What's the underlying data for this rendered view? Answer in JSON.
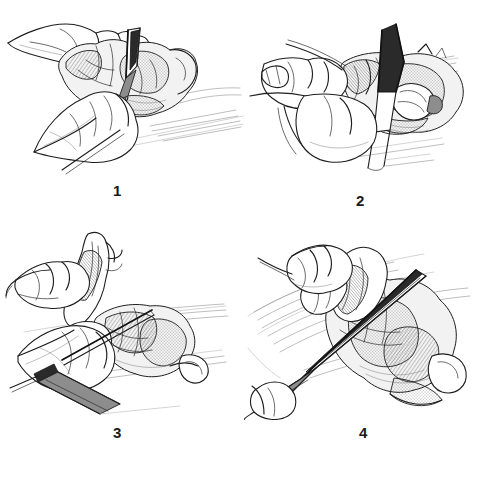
{
  "figure": {
    "style": "black-and-white pen-and-ink line drawing",
    "background_color": "#ffffff",
    "ink_color": "#1e1e1e",
    "layout": "2 x 2 grid of captioned illustration panels",
    "panels": [
      {
        "id": "panel-1",
        "number": "1",
        "caption": "1",
        "description": "Two hands hold a bird carcass breast-side up on a cutting board while a knife blade cuts downward into the body cavity",
        "elements": [
          "left hand gripping far side of carcass",
          "right hand and forearm resting on board",
          "knife blade angled down into carcass",
          "cutting board with shaded edge",
          "bird carcass with exposed rib and breast detail"
        ]
      },
      {
        "id": "panel-2",
        "number": "2",
        "caption": "2",
        "description": "A hand steadies the carcass from the left as a large dark-shaded knife blade is driven vertically down through the backbone",
        "elements": [
          "large wedge-shaped knife blade, dark shaded",
          "knife handle extending down-right",
          "left hand with thumb and fingers bracing carcass",
          "split carcass with exposed cavity at right",
          "table and board surface lines"
        ]
      },
      {
        "id": "panel-3",
        "number": "3",
        "caption": "3",
        "description": "One hand pulls up the wing or leg of the carcass while the other hand holds a knife low against the board, separating a joint",
        "elements": [
          "upper hand pinching and lifting limb upward",
          "lower hand with knife held flat near board",
          "knife blade pointing up and to the right",
          "dark knife bolster and long handle to lower-left",
          "carcass lying on board, ribs and joints visible"
        ]
      },
      {
        "id": "panel-4",
        "number": "4",
        "caption": "4",
        "description": "A long knife is drawn diagonally across a flattened, splayed carcass while the other hand holds the meat steady from above",
        "elements": [
          "long diagonal knife blade crossing the frame",
          "knife handle at lower-left with dark grip",
          "hand at upper-left gripping lifted flap of meat",
          "splayed carcass with heavy stippled shading",
          "board lines receding to upper right"
        ]
      }
    ]
  }
}
